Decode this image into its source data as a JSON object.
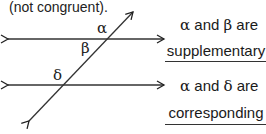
{
  "diagram": {
    "note": "(not congruent).",
    "angle_labels": {
      "alpha": "α",
      "beta": "β",
      "delta": "δ"
    },
    "statements": [
      {
        "first": "α",
        "connector": "and",
        "second": "β",
        "verb": "are",
        "answer": "supplementary"
      },
      {
        "first": "α",
        "connector": "and",
        "second": "δ",
        "verb": "are",
        "answer": "corresponding"
      }
    ]
  }
}
